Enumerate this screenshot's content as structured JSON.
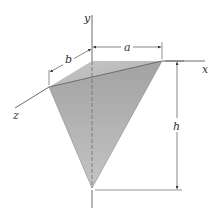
{
  "diagram": {
    "type": "3D tetrahedron with coordinate axes and dimension labels",
    "axes": {
      "x_label": "x",
      "y_label": "y",
      "z_label": "z"
    },
    "dimensions": {
      "a_label": "a",
      "b_label": "b",
      "h_label": "h"
    },
    "colors": {
      "solid_fill_top": "#b8b8b8",
      "solid_fill_front": "#a6a6a6",
      "line": "#444444",
      "hidden_line": "#777777"
    }
  }
}
